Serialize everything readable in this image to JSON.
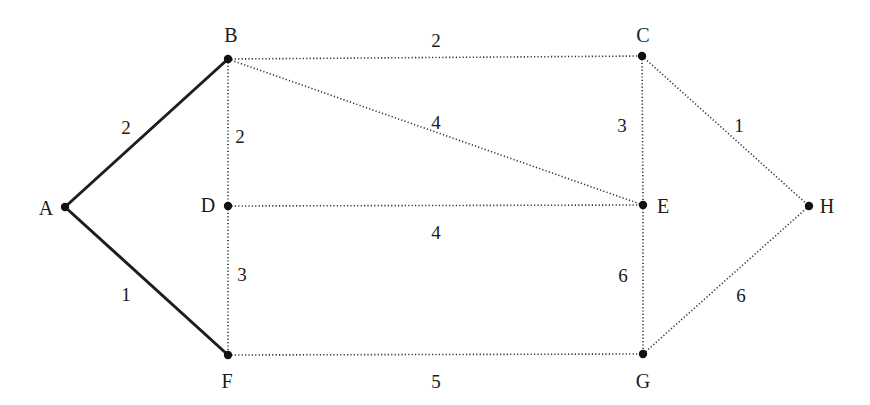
{
  "diagram": {
    "type": "weighted-graph",
    "colors": {
      "background": "#ffffff",
      "edge": "#1e1e1e",
      "node": "#111111",
      "text": "#1a1a1a"
    },
    "nodes": [
      {
        "id": "A",
        "label": "A",
        "x": 65,
        "y": 207,
        "lx": 46,
        "ly": 215
      },
      {
        "id": "B",
        "label": "B",
        "x": 228,
        "y": 59,
        "lx": 231,
        "ly": 42
      },
      {
        "id": "C",
        "label": "C",
        "x": 642,
        "y": 56,
        "lx": 643,
        "ly": 42
      },
      {
        "id": "D",
        "label": "D",
        "x": 228,
        "y": 206,
        "lx": 208,
        "ly": 212
      },
      {
        "id": "E",
        "label": "E",
        "x": 643,
        "y": 205,
        "lx": 663,
        "ly": 213
      },
      {
        "id": "F",
        "label": "F",
        "x": 228,
        "y": 355,
        "lx": 227,
        "ly": 388
      },
      {
        "id": "G",
        "label": "G",
        "x": 643,
        "y": 354,
        "lx": 643,
        "ly": 388
      },
      {
        "id": "H",
        "label": "H",
        "x": 809,
        "y": 206,
        "lx": 827,
        "ly": 213
      }
    ],
    "edges": [
      {
        "from": "A",
        "to": "B",
        "weight": "2",
        "style": "bold",
        "wx": 126,
        "wy": 130
      },
      {
        "from": "A",
        "to": "F",
        "weight": "1",
        "style": "bold",
        "wx": 126,
        "wy": 297
      },
      {
        "from": "B",
        "to": "C",
        "weight": "2",
        "style": "dotted",
        "wx": 436,
        "wy": 43
      },
      {
        "from": "B",
        "to": "D",
        "weight": "2",
        "style": "dotted",
        "wx": 240,
        "wy": 139
      },
      {
        "from": "B",
        "to": "E",
        "weight": "4",
        "style": "dotted",
        "wx": 436,
        "wy": 125
      },
      {
        "from": "C",
        "to": "E",
        "weight": "3",
        "style": "dotted",
        "wx": 622,
        "wy": 128
      },
      {
        "from": "C",
        "to": "H",
        "weight": "1",
        "style": "dotted",
        "wx": 739,
        "wy": 128
      },
      {
        "from": "D",
        "to": "E",
        "weight": "4",
        "style": "dotted",
        "wx": 436,
        "wy": 235
      },
      {
        "from": "D",
        "to": "F",
        "weight": "3",
        "style": "dotted",
        "wx": 242,
        "wy": 277
      },
      {
        "from": "E",
        "to": "G",
        "weight": "6",
        "style": "dotted",
        "wx": 623,
        "wy": 278
      },
      {
        "from": "H",
        "to": "G",
        "weight": "6",
        "style": "dotted",
        "wx": 741,
        "wy": 298
      },
      {
        "from": "F",
        "to": "G",
        "weight": "5",
        "style": "dotted",
        "wx": 436,
        "wy": 384
      }
    ]
  }
}
